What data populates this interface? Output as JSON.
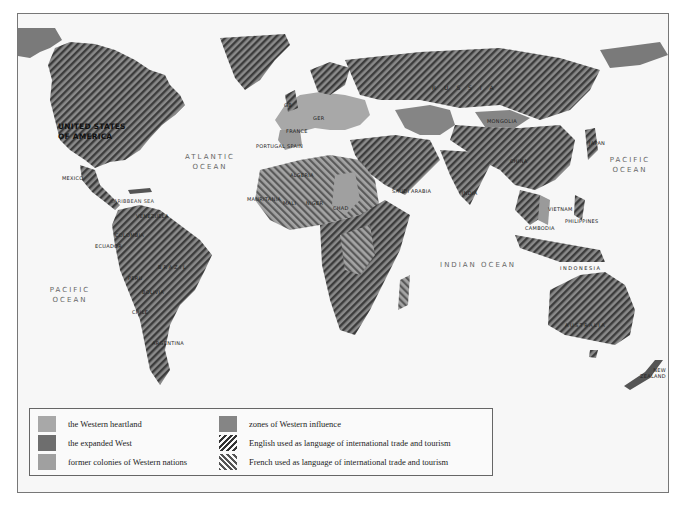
{
  "map": {
    "colors": {
      "ocean": "#f7f7f7",
      "western_heartland": "#a8a8a8",
      "expanded_west": "#6e6e6e",
      "former_colonies": "#a0a0a0",
      "zones_of_influence": "#858585",
      "hatch_dark": "#3a3a3a"
    },
    "oceans": [
      {
        "id": "atlantic",
        "line1": "ATLANTIC",
        "line2": "OCEAN"
      },
      {
        "id": "pacific-west",
        "line1": "PACIFIC",
        "line2": "OCEAN"
      },
      {
        "id": "pacific-east",
        "line1": "PACIFIC",
        "line2": "OCEAN"
      },
      {
        "id": "indian",
        "line1": "INDIAN OCEAN"
      }
    ],
    "seas": [
      {
        "id": "caribbean",
        "label": "CARIBBEAN SEA"
      }
    ],
    "countries": {
      "usa_line1": "UNITED STATES",
      "usa_line2": "OF AMERICA",
      "mexico": "MEXICO",
      "venezuela": "VENEZUELA",
      "colombia": "COLOMBIA",
      "ecuador": "ECUADOR",
      "brazil": "BRAZIL",
      "peru": "PERU",
      "bolivia": "BOLIVIA",
      "chile": "CHILE",
      "argentina": "ARGENTINA",
      "portugal": "PORTUGAL",
      "spain": "SPAIN",
      "france": "FRANCE",
      "ger": "GER",
      "gb": "GB",
      "algeria": "ALGERIA",
      "mali": "MALI",
      "niger": "NIGER",
      "chad": "CHAD",
      "mauritania": "MAURITANIA",
      "russia": "R U S S I A",
      "mongolia": "MONGOLIA",
      "china": "CHINA",
      "india": "INDIA",
      "saudi": "SAUDI ARABIA",
      "japan": "JAPAN",
      "vietnam": "VIETNAM",
      "cambodia": "CAMBODIA",
      "philippines": "PHILIPPINES",
      "indonesia": "INDONESIA",
      "australia": "AUSTRALIA",
      "nz_line1": "NEW",
      "nz_line2": "ZEALAND"
    }
  },
  "legend": {
    "items": [
      {
        "id": "western-heartland",
        "label": "the Western heartland",
        "swatch": "solid-light"
      },
      {
        "id": "expanded-west",
        "label": "the expanded West",
        "swatch": "solid-dark"
      },
      {
        "id": "former-colonies",
        "label": "former colonies of Western nations",
        "swatch": "solid-light2"
      },
      {
        "id": "zones-influence",
        "label": "zones of  Western influence",
        "swatch": "solid-mid"
      },
      {
        "id": "english",
        "label": "English used as language of international trade and tourism",
        "swatch": "hatch-forward"
      },
      {
        "id": "french",
        "label": "French used as language of international trade and tourism",
        "swatch": "hatch-back"
      }
    ]
  }
}
